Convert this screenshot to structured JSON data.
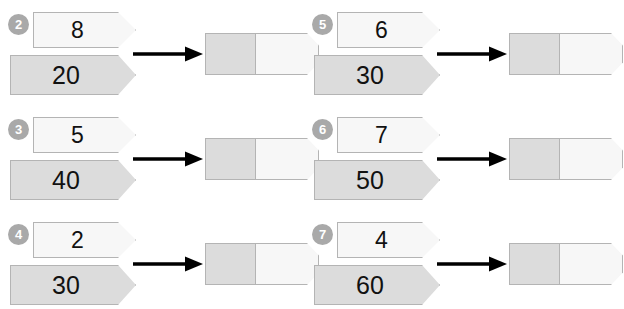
{
  "worksheet": {
    "colors": {
      "page_background": "#ffffff",
      "badge_fill": "#a9a9a9",
      "badge_text": "#ffffff",
      "banner_light_fill": "#f7f7f7",
      "banner_dark_fill": "#dcdcdc",
      "banner_border": "#b4b4b4",
      "arrow_color": "#000000",
      "result_left_fill": "#dcdcdc",
      "result_right_fill": "#f7f7f7"
    },
    "problems": [
      {
        "number": "2",
        "small_value": "8",
        "large_value": "20",
        "arrow": "right-arrow",
        "result": {
          "left_segment": "",
          "right_segment": ""
        }
      },
      {
        "number": "5",
        "small_value": "6",
        "large_value": "30",
        "arrow": "right-arrow",
        "result": {
          "left_segment": "",
          "right_segment": ""
        }
      },
      {
        "number": "3",
        "small_value": "5",
        "large_value": "40",
        "arrow": "right-arrow",
        "result": {
          "left_segment": "",
          "right_segment": ""
        }
      },
      {
        "number": "6",
        "small_value": "7",
        "large_value": "50",
        "arrow": "right-arrow",
        "result": {
          "left_segment": "",
          "right_segment": ""
        }
      },
      {
        "number": "4",
        "small_value": "2",
        "large_value": "30",
        "arrow": "right-arrow",
        "result": {
          "left_segment": "",
          "right_segment": ""
        }
      },
      {
        "number": "7",
        "small_value": "4",
        "large_value": "60",
        "arrow": "right-arrow",
        "result": {
          "left_segment": "",
          "right_segment": ""
        }
      }
    ]
  }
}
